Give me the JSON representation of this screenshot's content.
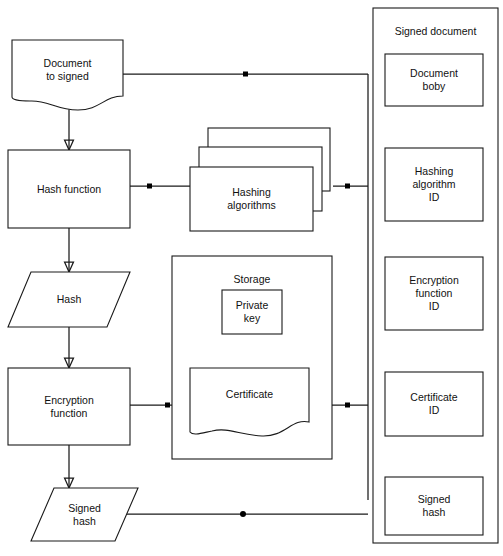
{
  "diagram": {
    "type": "flowchart",
    "canvas": {
      "width": 503,
      "height": 556
    },
    "style": {
      "stroke": "#1a1a1a",
      "fill": "#ffffff",
      "text": "#111111"
    }
  },
  "nodes": {
    "document_to_signed": {
      "label": "Document\nto signed",
      "shape": "document"
    },
    "hash_function": {
      "label": "Hash function",
      "shape": "process"
    },
    "hash": {
      "label": "Hash",
      "shape": "data-parallelogram"
    },
    "encryption_function": {
      "label": "Encryption\nfunction",
      "shape": "process"
    },
    "signed_hash_left": {
      "label": "Signed\nhash",
      "shape": "data-parallelogram"
    },
    "hashing_algorithms": {
      "label": "Hashing\nalgorithms",
      "shape": "stacked-process"
    },
    "storage": {
      "label": "Storage",
      "shape": "container"
    },
    "private_key": {
      "label": "Private\nkey",
      "shape": "process"
    },
    "certificate": {
      "label": "Certificate",
      "shape": "document"
    }
  },
  "signed_document_panel": {
    "title": "Signed document",
    "items": [
      {
        "label": "Document\nboby"
      },
      {
        "label": "Hashing\nalgorithm\nID"
      },
      {
        "label": "Encryption\nfunction\nID"
      },
      {
        "label": "Certificate\nID"
      },
      {
        "label": "Signed\nhash"
      }
    ]
  },
  "connectors": [
    {
      "from": "document_to_signed",
      "to": "hash_function",
      "arrow": true
    },
    {
      "from": "hash_function",
      "to": "hash",
      "arrow": true
    },
    {
      "from": "hash",
      "to": "encryption_function",
      "arrow": true
    },
    {
      "from": "encryption_function",
      "to": "signed_hash_left",
      "arrow": true
    },
    {
      "from": "document_to_signed",
      "to": "signed_document_panel",
      "arrow": false,
      "marker": "square"
    },
    {
      "from": "hash_function",
      "to": "hashing_algorithms",
      "arrow": false,
      "marker": "square"
    },
    {
      "from": "hashing_algorithms",
      "to": "signed_document_panel",
      "arrow": false,
      "marker": "square"
    },
    {
      "from": "encryption_function",
      "to": "certificate",
      "arrow": false,
      "marker": "square"
    },
    {
      "from": "certificate",
      "to": "signed_document_panel",
      "arrow": false,
      "marker": "square"
    },
    {
      "from": "private_key",
      "to": "certificate",
      "arrow": false,
      "marker": "filled-diamond"
    },
    {
      "from": "signed_hash_left",
      "to": "signed_document_panel",
      "arrow": false,
      "marker": "round"
    }
  ]
}
